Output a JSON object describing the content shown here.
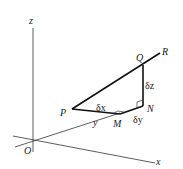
{
  "diagram": {
    "axes": {
      "x": "x",
      "y": "y",
      "z": "z",
      "origin": "O"
    },
    "points": {
      "P": "P",
      "Q": "Q",
      "R": "R",
      "M": "M",
      "N": "N"
    },
    "increments": {
      "dx": "δx",
      "dy": "δy",
      "dz": "δz"
    },
    "colors": {
      "stroke": "#222222",
      "background": "#ffffff"
    }
  }
}
